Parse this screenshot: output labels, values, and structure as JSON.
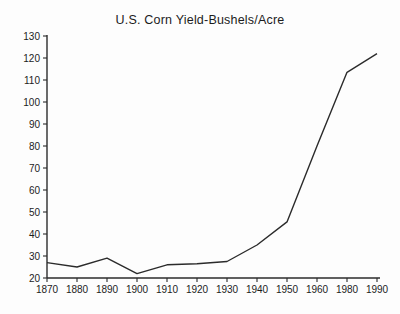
{
  "chart_data": {
    "type": "line",
    "title": "U.S. Corn Yield-Bushels/Acre",
    "categories": [
      "1870",
      "1880",
      "1890",
      "1900",
      "1910",
      "1920",
      "1930",
      "1940",
      "1950",
      "1960",
      "1980",
      "1990"
    ],
    "values": [
      27,
      25,
      29,
      22,
      26,
      26.5,
      27.5,
      35,
      45.5,
      80,
      113.5,
      122
    ],
    "xlabel": "",
    "ylabel": "",
    "ylim": [
      20,
      130
    ],
    "ytick_step": 10,
    "yticks": [
      20,
      30,
      40,
      50,
      60,
      70,
      80,
      90,
      100,
      110,
      120,
      130
    ],
    "grid": false,
    "legend_position": "none"
  },
  "colors": {
    "line": "#2b2b2b",
    "axis": "#2b2b2b",
    "text": "#1c1c1c",
    "background": "#fdfdfd"
  }
}
